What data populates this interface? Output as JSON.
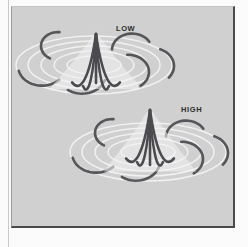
{
  "figure": {
    "caption_labels": [
      "LOW",
      "HIGH"
    ],
    "background_color": "#d0d0d0",
    "panel_color": "#d0d0d0",
    "outer_margin_color": "#fbfbfb",
    "border_color": "#4a4a4a",
    "ring_color": "#f2f2f2",
    "arc_color": "#55555a",
    "plume_color": "#4a4a4f",
    "label_color": "#2c2c2c"
  },
  "panels": [
    {
      "id": "panel-low",
      "label": "LOW",
      "label_x": 116,
      "label_y": 24,
      "center_x": 94,
      "center_y": 65,
      "rings": [
        {
          "rx": 78,
          "ry": 29
        },
        {
          "rx": 66,
          "ry": 24
        },
        {
          "rx": 53,
          "ry": 19
        },
        {
          "rx": 40,
          "ry": 14
        },
        {
          "rx": 27,
          "ry": 9
        }
      ],
      "arcs": [
        {
          "cx": 58,
          "cy": 46,
          "r": 17,
          "start": 118,
          "end": 275,
          "w": 2.6
        },
        {
          "cx": 42,
          "cy": 66,
          "r": 24,
          "start": 44,
          "end": 166,
          "w": 2.6
        },
        {
          "cx": 82,
          "cy": 74,
          "r": 24,
          "start": 18,
          "end": 126,
          "w": 2.6
        },
        {
          "cx": 132,
          "cy": 50,
          "r": 20,
          "start": 182,
          "end": 330,
          "w": 2.6
        },
        {
          "cx": 128,
          "cy": 72,
          "r": 21,
          "start": 268,
          "end": 56,
          "w": 2.6
        },
        {
          "cx": 152,
          "cy": 66,
          "r": 22,
          "start": 292,
          "end": 40,
          "w": 2.6
        }
      ],
      "plume": {
        "apex_x": 96,
        "apex_y": 34,
        "stem_bottom_y": 83,
        "tines": [
          {
            "dx": -24,
            "dy": 78,
            "ctrl_dx": -5,
            "ctrl_dy": 62
          },
          {
            "dx": -13,
            "dy": 84,
            "ctrl_dx": -2,
            "ctrl_dy": 66
          },
          {
            "dx": 13,
            "dy": 84,
            "ctrl_dx": 2,
            "ctrl_dy": 66
          },
          {
            "dx": 24,
            "dy": 78,
            "ctrl_dx": 5,
            "ctrl_dy": 62
          }
        ]
      }
    },
    {
      "id": "panel-high",
      "label": "HIGH",
      "label_x": 181,
      "label_y": 105,
      "center_x": 148,
      "center_y": 152,
      "rings": [
        {
          "rx": 78,
          "ry": 29
        },
        {
          "rx": 66,
          "ry": 24
        },
        {
          "rx": 53,
          "ry": 19
        },
        {
          "rx": 40,
          "ry": 14
        },
        {
          "rx": 27,
          "ry": 9
        }
      ],
      "arcs": [
        {
          "cx": 112,
          "cy": 133,
          "r": 17,
          "start": 118,
          "end": 275,
          "w": 2.6
        },
        {
          "cx": 96,
          "cy": 153,
          "r": 24,
          "start": 44,
          "end": 166,
          "w": 2.6
        },
        {
          "cx": 136,
          "cy": 161,
          "r": 24,
          "start": 18,
          "end": 126,
          "w": 2.6
        },
        {
          "cx": 186,
          "cy": 137,
          "r": 20,
          "start": 182,
          "end": 330,
          "w": 2.6
        },
        {
          "cx": 182,
          "cy": 159,
          "r": 21,
          "start": 268,
          "end": 56,
          "w": 2.6
        },
        {
          "cx": 206,
          "cy": 153,
          "r": 22,
          "start": 292,
          "end": 40,
          "w": 2.6
        }
      ],
      "plume": {
        "apex_x": 150,
        "apex_y": 110,
        "stem_bottom_y": 165,
        "tines": [
          {
            "dx": -24,
            "dy": 78,
            "ctrl_dx": -5,
            "ctrl_dy": 62
          },
          {
            "dx": -13,
            "dy": 84,
            "ctrl_dx": -2,
            "ctrl_dy": 66
          },
          {
            "dx": 13,
            "dy": 84,
            "ctrl_dx": 2,
            "ctrl_dy": 66
          },
          {
            "dx": 24,
            "dy": 78,
            "ctrl_dx": 5,
            "ctrl_dy": 62
          }
        ]
      }
    }
  ],
  "frame": {
    "inner_left": 11,
    "inner_top": 6,
    "inner_width": 224,
    "inner_height": 222
  }
}
